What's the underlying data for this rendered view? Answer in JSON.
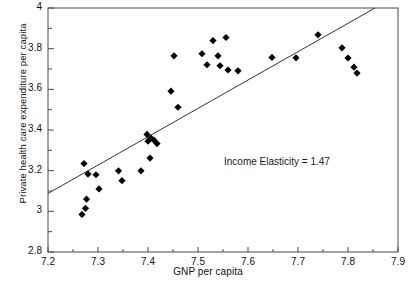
{
  "chart_data": {
    "type": "scatter",
    "title": "",
    "xlabel": "GNP per capita",
    "ylabel": "Private health care expenditure per capita",
    "xlim": [
      7.2,
      7.9
    ],
    "ylim": [
      2.8,
      4.0
    ],
    "xticks": [
      "7.2",
      "7.3",
      "7.4",
      "7.5",
      "7.6",
      "7.7",
      "7.8",
      "7.9"
    ],
    "xtick_values": [
      7.2,
      7.3,
      7.4,
      7.5,
      7.6,
      7.7,
      7.8,
      7.9
    ],
    "yticks": [
      "2.8",
      "3",
      "3.2",
      "3.4",
      "3.6",
      "3.8",
      "4"
    ],
    "ytick_values": [
      2.8,
      3.0,
      3.2,
      3.4,
      3.6,
      3.8,
      4.0
    ],
    "minor_xtick_values": [
      7.25,
      7.35,
      7.45,
      7.55,
      7.65,
      7.75,
      7.85
    ],
    "minor_ytick_values": [
      2.9,
      3.1,
      3.3,
      3.5,
      3.7,
      3.9
    ],
    "grid": false,
    "legend": null,
    "marker": "diamond",
    "marker_color": "#000000",
    "line_color": "#333333",
    "points": [
      {
        "x": 7.268,
        "y": 2.985
      },
      {
        "x": 7.275,
        "y": 3.015
      },
      {
        "x": 7.277,
        "y": 3.06
      },
      {
        "x": 7.272,
        "y": 3.235
      },
      {
        "x": 7.28,
        "y": 3.183
      },
      {
        "x": 7.296,
        "y": 3.18
      },
      {
        "x": 7.302,
        "y": 3.11
      },
      {
        "x": 7.341,
        "y": 3.199
      },
      {
        "x": 7.348,
        "y": 3.151
      },
      {
        "x": 7.386,
        "y": 3.199
      },
      {
        "x": 7.398,
        "y": 3.378
      },
      {
        "x": 7.404,
        "y": 3.262
      },
      {
        "x": 7.4,
        "y": 3.345
      },
      {
        "x": 7.406,
        "y": 3.36
      },
      {
        "x": 7.412,
        "y": 3.35
      },
      {
        "x": 7.418,
        "y": 3.333
      },
      {
        "x": 7.446,
        "y": 3.591
      },
      {
        "x": 7.452,
        "y": 3.765
      },
      {
        "x": 7.46,
        "y": 3.512
      },
      {
        "x": 7.508,
        "y": 3.775
      },
      {
        "x": 7.518,
        "y": 3.721
      },
      {
        "x": 7.53,
        "y": 3.84
      },
      {
        "x": 7.54,
        "y": 3.765
      },
      {
        "x": 7.544,
        "y": 3.716
      },
      {
        "x": 7.556,
        "y": 3.855
      },
      {
        "x": 7.56,
        "y": 3.695
      },
      {
        "x": 7.58,
        "y": 3.691
      },
      {
        "x": 7.648,
        "y": 3.757
      },
      {
        "x": 7.696,
        "y": 3.755
      },
      {
        "x": 7.74,
        "y": 3.868
      },
      {
        "x": 7.788,
        "y": 3.804
      },
      {
        "x": 7.8,
        "y": 3.754
      },
      {
        "x": 7.812,
        "y": 3.709
      },
      {
        "x": 7.818,
        "y": 3.68
      }
    ],
    "trend_line": {
      "x1": 7.2,
      "y1": 3.088,
      "x2": 7.854,
      "y2": 4.0,
      "slope": 1.47
    },
    "annotation": "Income Elasticity = 1.47"
  }
}
